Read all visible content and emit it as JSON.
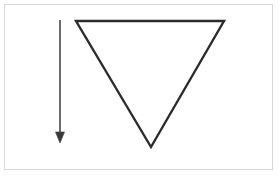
{
  "figure": {
    "canvas": {
      "width": 279,
      "height": 176,
      "background_color": "#ffffff"
    },
    "frame": {
      "label": "figure border",
      "x": 4,
      "y": 4,
      "width": 269,
      "height": 166,
      "stroke_color": "#d8d8d8",
      "stroke_width": 1
    },
    "shapes": [
      {
        "name": "inverted-triangle",
        "type": "polygon",
        "points": "76,21 224,21 151,147",
        "vertices": [
          {
            "label": "top-left",
            "x": 76,
            "y": 21
          },
          {
            "label": "top-right",
            "x": 224,
            "y": 21
          },
          {
            "label": "bottom-apex",
            "x": 151,
            "y": 147
          }
        ],
        "stroke_color": "#2b2b2b",
        "stroke_width": 2.4,
        "fill": "none",
        "orientation": "pointing-down"
      },
      {
        "name": "downward-arrow",
        "type": "arrow",
        "direction": "down",
        "shaft": {
          "x1": 60,
          "y1": 20,
          "x2": 60,
          "y2": 134
        },
        "head": {
          "points": "55.5,132 64.5,132 60,143",
          "tip_x": 60,
          "tip_y": 143,
          "width": 9,
          "height": 11
        },
        "stroke_color": "#3a3a3a",
        "stroke_width": 1.5,
        "fill_color": "#3a3a3a"
      }
    ]
  },
  "colors": {
    "background": "#ffffff",
    "frame_border": "#d8d8d8",
    "triangle_stroke": "#2b2b2b",
    "arrow_stroke": "#3a3a3a"
  }
}
